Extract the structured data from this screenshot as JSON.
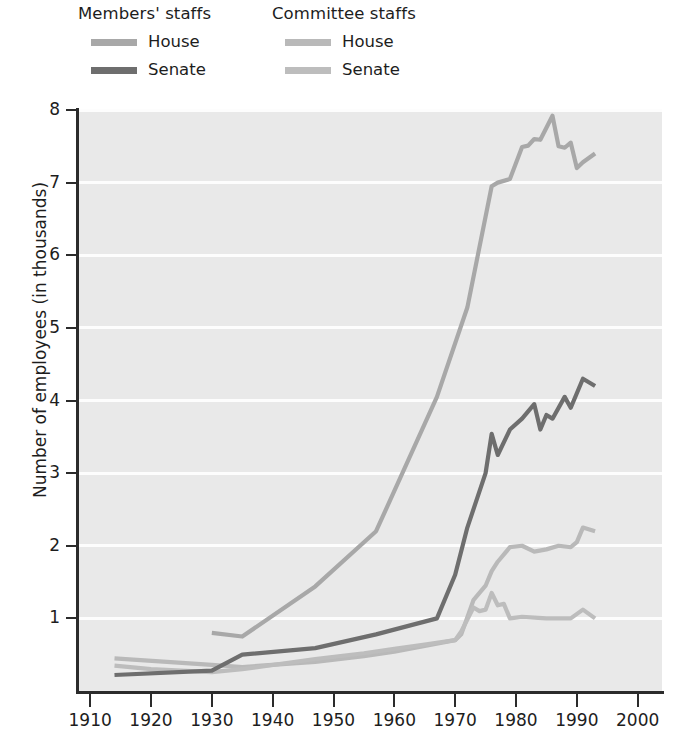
{
  "legend": {
    "groups": [
      {
        "name": "members-staffs",
        "title": "Members' staffs",
        "entries": [
          {
            "label": "House",
            "color": "#a8a8a8"
          },
          {
            "label": "Senate",
            "color": "#6e6e6e"
          }
        ]
      },
      {
        "name": "committee-staffs",
        "title": "Committee staffs",
        "entries": [
          {
            "label": "House",
            "color": "#b9b9b9"
          },
          {
            "label": "Senate",
            "color": "#bdbdbd"
          }
        ]
      }
    ]
  },
  "axes": {
    "ylabel": "Number of employees (in thousands)",
    "yticks": [
      "1",
      "2",
      "3",
      "4",
      "5",
      "6",
      "7",
      "8"
    ],
    "xticks": [
      "1910",
      "1920",
      "1930",
      "1940",
      "1950",
      "1960",
      "1970",
      "1980",
      "1990",
      "2000"
    ]
  },
  "style": {
    "plot_background": "#e9e9e9",
    "gridline_color": "#fdfdfd",
    "axis_color": "#2b2b2b",
    "text_color": "#1d1d1d"
  },
  "chart_data": {
    "type": "line",
    "title": "",
    "xlabel": "",
    "ylabel": "Number of employees (in thousands)",
    "xlim": [
      1908,
      2004
    ],
    "ylim": [
      0,
      8
    ],
    "yticks": [
      1,
      2,
      3,
      4,
      5,
      6,
      7,
      8
    ],
    "xticks": [
      1910,
      1920,
      1930,
      1940,
      1950,
      1960,
      1970,
      1980,
      1990,
      2000
    ],
    "grid": "horizontal-white-gridlines",
    "legend_position": "above-plot",
    "units": "thousands of employees",
    "series": [
      {
        "name": "Members' staffs — House",
        "color": "#a8a8a8",
        "points": [
          [
            1930,
            0.8
          ],
          [
            1935,
            0.75
          ],
          [
            1947,
            1.44
          ],
          [
            1957,
            2.2
          ],
          [
            1967,
            4.05
          ],
          [
            1972,
            5.28
          ],
          [
            1976,
            6.95
          ],
          [
            1977,
            7.0
          ],
          [
            1979,
            7.05
          ],
          [
            1981,
            7.49
          ],
          [
            1982,
            7.51
          ],
          [
            1983,
            7.6
          ],
          [
            1984,
            7.59
          ],
          [
            1986,
            7.92
          ],
          [
            1987,
            7.5
          ],
          [
            1988,
            7.48
          ],
          [
            1989,
            7.55
          ],
          [
            1990,
            7.2
          ],
          [
            1991,
            7.28
          ],
          [
            1993,
            7.4
          ]
        ]
      },
      {
        "name": "Members' staffs — Senate",
        "color": "#6e6e6e",
        "points": [
          [
            1914,
            0.22
          ],
          [
            1930,
            0.28
          ],
          [
            1935,
            0.5
          ],
          [
            1947,
            0.59
          ],
          [
            1957,
            0.78
          ],
          [
            1967,
            1.0
          ],
          [
            1970,
            1.6
          ],
          [
            1972,
            2.25
          ],
          [
            1975,
            3.0
          ],
          [
            1976,
            3.54
          ],
          [
            1977,
            3.25
          ],
          [
            1979,
            3.6
          ],
          [
            1981,
            3.75
          ],
          [
            1983,
            3.95
          ],
          [
            1984,
            3.6
          ],
          [
            1985,
            3.8
          ],
          [
            1986,
            3.75
          ],
          [
            1988,
            4.05
          ],
          [
            1989,
            3.9
          ],
          [
            1991,
            4.3
          ],
          [
            1993,
            4.2
          ]
        ]
      },
      {
        "name": "Committee staffs — House",
        "color": "#b9b9b9",
        "points": [
          [
            1914,
            0.45
          ],
          [
            1930,
            0.36
          ],
          [
            1935,
            0.33
          ],
          [
            1947,
            0.4
          ],
          [
            1955,
            0.48
          ],
          [
            1960,
            0.54
          ],
          [
            1965,
            0.62
          ],
          [
            1970,
            0.7
          ],
          [
            1971,
            0.78
          ],
          [
            1973,
            1.25
          ],
          [
            1975,
            1.45
          ],
          [
            1976,
            1.65
          ],
          [
            1977,
            1.78
          ],
          [
            1979,
            1.98
          ],
          [
            1981,
            2.0
          ],
          [
            1983,
            1.92
          ],
          [
            1985,
            1.95
          ],
          [
            1987,
            2.0
          ],
          [
            1989,
            1.98
          ],
          [
            1990,
            2.05
          ],
          [
            1991,
            2.25
          ],
          [
            1993,
            2.2
          ]
        ]
      },
      {
        "name": "Committee staffs — Senate",
        "color": "#bdbdbd",
        "points": [
          [
            1914,
            0.35
          ],
          [
            1920,
            0.3
          ],
          [
            1930,
            0.26
          ],
          [
            1935,
            0.3
          ],
          [
            1947,
            0.44
          ],
          [
            1955,
            0.52
          ],
          [
            1960,
            0.58
          ],
          [
            1965,
            0.64
          ],
          [
            1970,
            0.7
          ],
          [
            1971,
            0.82
          ],
          [
            1973,
            1.15
          ],
          [
            1974,
            1.1
          ],
          [
            1975,
            1.12
          ],
          [
            1976,
            1.35
          ],
          [
            1977,
            1.18
          ],
          [
            1978,
            1.2
          ],
          [
            1979,
            1.0
          ],
          [
            1981,
            1.02
          ],
          [
            1985,
            1.0
          ],
          [
            1989,
            1.0
          ],
          [
            1991,
            1.12
          ],
          [
            1993,
            1.0
          ]
        ]
      }
    ]
  }
}
